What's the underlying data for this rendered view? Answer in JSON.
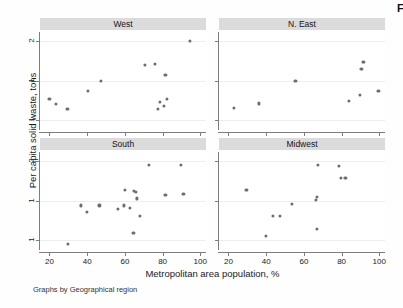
{
  "figure": {
    "corner_mark": "F",
    "note": "Graphs by Geographical region",
    "marker_color": "#6e6e6e",
    "strip_color": "#dbdbdb",
    "grid_color": "#eeeeee"
  },
  "chart_data": {
    "type": "scatter",
    "title": "",
    "xlabel": "Metropolitan area population, %",
    "ylabel": "Per capita solid waste, tons",
    "xlim": [
      15,
      103
    ],
    "ylim_log": [
      0.42,
      2.35
    ],
    "yscale": "log",
    "xticks": [
      20,
      40,
      60,
      80,
      100
    ],
    "xticklabels": [
      "20",
      "40",
      "60",
      "80",
      "100"
    ],
    "yticks": [
      2,
      1,
      0.5
    ],
    "yticklabels": [
      "2",
      "1",
      "1"
    ],
    "grid": "horizontal",
    "legend": "none",
    "facet_by": "Geographical region",
    "panels": [
      {
        "label": "West",
        "position": "top-left",
        "points": [
          {
            "x": 20.0,
            "y": 0.72
          },
          {
            "x": 23.5,
            "y": 0.66
          },
          {
            "x": 29.5,
            "y": 0.61
          },
          {
            "x": 40.5,
            "y": 0.84
          },
          {
            "x": 47.5,
            "y": 1.0
          },
          {
            "x": 70.5,
            "y": 1.32
          },
          {
            "x": 76.0,
            "y": 1.34
          },
          {
            "x": 77.5,
            "y": 0.61
          },
          {
            "x": 78.5,
            "y": 0.69
          },
          {
            "x": 80.5,
            "y": 0.64
          },
          {
            "x": 81.5,
            "y": 1.1
          },
          {
            "x": 82.5,
            "y": 0.72
          },
          {
            "x": 94.5,
            "y": 2.02
          }
        ]
      },
      {
        "label": "N. East",
        "position": "top-right",
        "points": [
          {
            "x": 23.0,
            "y": 0.62
          },
          {
            "x": 36.0,
            "y": 0.67
          },
          {
            "x": 55.5,
            "y": 1.0
          },
          {
            "x": 84.0,
            "y": 0.7
          },
          {
            "x": 89.5,
            "y": 0.78
          },
          {
            "x": 90.5,
            "y": 1.22
          },
          {
            "x": 91.5,
            "y": 1.38
          },
          {
            "x": 92.0,
            "y": 1.4
          },
          {
            "x": 99.5,
            "y": 0.84
          }
        ]
      },
      {
        "label": "South",
        "position": "bottom-left",
        "points": [
          {
            "x": 30.0,
            "y": 0.47
          },
          {
            "x": 36.5,
            "y": 0.92
          },
          {
            "x": 40.0,
            "y": 0.82
          },
          {
            "x": 46.5,
            "y": 0.92
          },
          {
            "x": 56.5,
            "y": 0.86
          },
          {
            "x": 59.5,
            "y": 0.92
          },
          {
            "x": 60.0,
            "y": 1.2
          },
          {
            "x": 62.5,
            "y": 0.88
          },
          {
            "x": 64.5,
            "y": 0.57
          },
          {
            "x": 65.0,
            "y": 1.18
          },
          {
            "x": 66.0,
            "y": 1.16
          },
          {
            "x": 66.5,
            "y": 1.04
          },
          {
            "x": 68.0,
            "y": 0.76
          },
          {
            "x": 72.5,
            "y": 1.87
          },
          {
            "x": 81.5,
            "y": 1.1
          },
          {
            "x": 89.5,
            "y": 1.87
          },
          {
            "x": 91.0,
            "y": 1.12
          }
        ]
      },
      {
        "label": "Midwest",
        "position": "bottom-right",
        "points": [
          {
            "x": 29.5,
            "y": 1.2
          },
          {
            "x": 40.0,
            "y": 0.54
          },
          {
            "x": 43.5,
            "y": 0.76
          },
          {
            "x": 47.5,
            "y": 0.76
          },
          {
            "x": 53.5,
            "y": 0.94
          },
          {
            "x": 66.5,
            "y": 1.02
          },
          {
            "x": 67.0,
            "y": 1.06
          },
          {
            "x": 67.0,
            "y": 0.61
          },
          {
            "x": 67.5,
            "y": 1.87
          },
          {
            "x": 78.5,
            "y": 1.85
          },
          {
            "x": 79.5,
            "y": 1.48
          },
          {
            "x": 82.0,
            "y": 1.5
          }
        ]
      }
    ]
  }
}
